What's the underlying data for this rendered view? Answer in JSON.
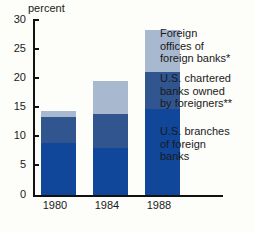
{
  "chart_data": {
    "type": "bar",
    "title": "",
    "subtitle": "",
    "xlabel": "",
    "ylabel": "percent",
    "ylim": [
      0,
      30
    ],
    "yticks": [
      30,
      25,
      20,
      15,
      10,
      5,
      0
    ],
    "grid": false,
    "legend_position": "right",
    "stacked": true,
    "categories": [
      "1980",
      "1984",
      "1988"
    ],
    "series": [
      {
        "name": "U.S. branches of foreign banks",
        "color": "#10479b",
        "values": [
          8.8,
          8.0,
          14.7
        ]
      },
      {
        "name": "U.S. chartered banks owned by foreigners**",
        "color": "#31558f",
        "values": [
          4.5,
          5.8,
          6.2
        ]
      },
      {
        "name": "Foreign offices of foreign banks*",
        "color": "#a8b8cf",
        "values": [
          1.1,
          5.6,
          7.3
        ]
      }
    ],
    "totals": [
      14.4,
      19.4,
      28.2
    ]
  },
  "axis": {
    "y_title": "percent",
    "y_tick_labels": [
      "30",
      "25",
      "20",
      "15",
      "10",
      "5",
      "0"
    ],
    "x_tick_labels": [
      "1980",
      "1984",
      "1988"
    ]
  },
  "legend": {
    "entries": [
      {
        "label": "Foreign offices of foreign banks*",
        "color": "#a8b8cf"
      },
      {
        "label": "U.S. chartered banks owned by foreigners**",
        "color": "#31558f"
      },
      {
        "label": "U.S. branches of foreign banks",
        "color": "#10479b"
      }
    ],
    "line1_a": "Foreign",
    "line1_b": "offices of",
    "line1_c": "foreign banks*",
    "line2_a": "U.S. chartered",
    "line2_b": "banks owned",
    "line2_c": "by foreigners**",
    "line3_a": "U.S. branches",
    "line3_b": "of foreign",
    "line3_c": "banks"
  },
  "colors": {
    "background": "#fdfdfa",
    "axis": "#111111",
    "text": "#1a1a1a",
    "dark_blue": "#10479b",
    "mid_blue": "#31558f",
    "light_blue": "#a8b8cf"
  }
}
